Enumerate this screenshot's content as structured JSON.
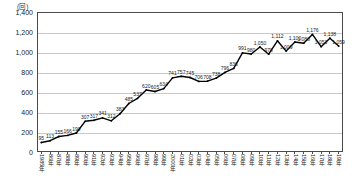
{
  "chart_data": {
    "type": "line",
    "title": "",
    "subtitle": "",
    "xlabel": "",
    "ylabel": "",
    "unit_label": "(回)",
    "ylim": [
      0,
      1400
    ],
    "ytick_step": 200,
    "yticks": [
      "0",
      "200",
      "400",
      "600",
      "800",
      "1,000",
      "1,200",
      "1,400"
    ],
    "grid": true,
    "legend": "none",
    "categories": [
      "1985年",
      "86年",
      "87年",
      "88年",
      "89年",
      "90年",
      "91年",
      "92年",
      "93年",
      "94年",
      "95年",
      "96年",
      "97年",
      "98年",
      "99年",
      "2000年",
      "01年",
      "02年",
      "03年",
      "04年",
      "05年",
      "06年",
      "07年",
      "08年",
      "09年",
      "10年",
      "11年",
      "12年",
      "13年",
      "14年",
      "15年",
      "16年",
      "17年",
      "18年",
      "19年"
    ],
    "values": [
      95,
      113,
      155,
      166,
      190,
      307,
      317,
      341,
      312,
      383,
      485,
      537,
      620,
      605,
      634,
      741,
      757,
      745,
      706,
      708,
      738,
      796,
      836,
      991,
      980,
      1050,
      978,
      1112,
      1009,
      1100,
      1088,
      1176,
      1053,
      1138,
      1059
    ],
    "point_labels": [
      "95",
      "113",
      "155",
      "166",
      "190",
      "307",
      "317",
      "341",
      "312",
      "383",
      "485",
      "537",
      "620",
      "605",
      "634",
      "741",
      "757",
      "745",
      "706",
      "708",
      "738",
      "796",
      "836",
      "991",
      "980",
      "1,050",
      "978",
      "1,112",
      "1,009",
      "1,100",
      "1,088",
      "1,176",
      "1,053",
      "1,138",
      "1,059"
    ],
    "series_color": "#000000",
    "grid_color": "#c9c9c9",
    "axis_color": "#4a4a4a"
  }
}
